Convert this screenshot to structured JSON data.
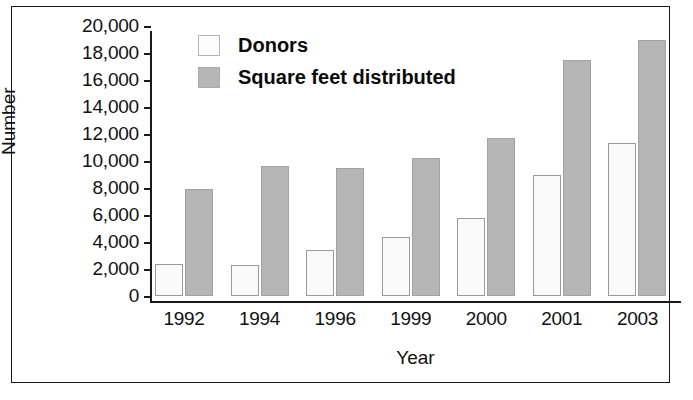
{
  "chart_data": {
    "type": "bar",
    "title": "",
    "xlabel": "Year",
    "ylabel": "Number",
    "categories": [
      "1992",
      "1994",
      "1996",
      "1999",
      "2000",
      "2001",
      "2003"
    ],
    "series": [
      {
        "name": "Donors",
        "values": [
          2400,
          2300,
          3400,
          4400,
          5800,
          9000,
          11300
        ],
        "color": "#fafafa"
      },
      {
        "name": "Square feet distributed",
        "values": [
          7950,
          9600,
          9500,
          10200,
          11700,
          17500,
          19000
        ],
        "color": "#b6b6b6"
      }
    ],
    "ylim": [
      0,
      20000
    ],
    "ytick_values": [
      0,
      2000,
      4000,
      6000,
      8000,
      10000,
      12000,
      14000,
      16000,
      18000,
      20000
    ],
    "ytick_labels": [
      "0",
      "2,000",
      "4,000",
      "6,000",
      "8,000",
      "10,000",
      "12,000",
      "14,000",
      "16,000",
      "18,000",
      "20,000"
    ],
    "grid": false,
    "legend_position": "top-left"
  },
  "legend": {
    "items": [
      {
        "label": "Donors",
        "swatch": "donors-swatch"
      },
      {
        "label": "Square feet distributed",
        "swatch": "sqft-swatch"
      }
    ]
  },
  "axes": {
    "y_title": "Number",
    "x_title": "Year"
  },
  "colors": {
    "donors_fill": "#fafafa",
    "sqft_fill": "#b6b6b6",
    "axis": "#1a1a1a",
    "text": "#111111",
    "frame": "#1a1a1a",
    "background": "#ffffff"
  }
}
